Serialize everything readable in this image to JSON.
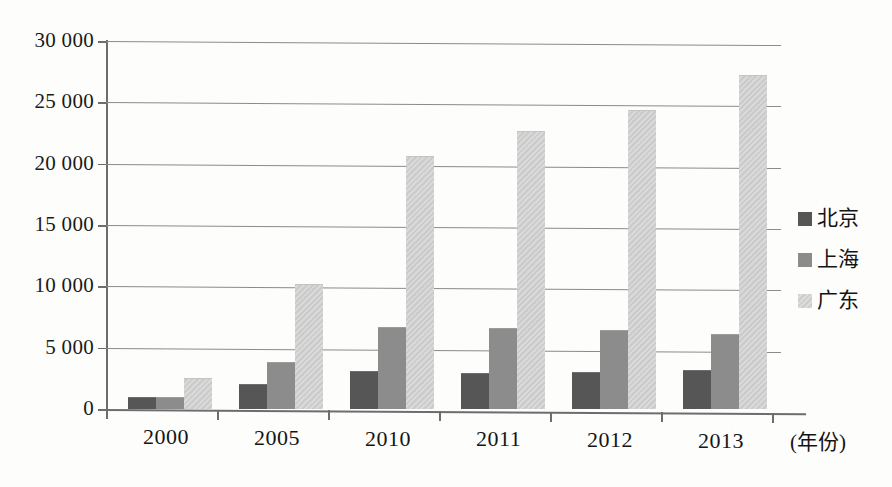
{
  "chart_data": {
    "type": "bar",
    "title": "",
    "xlabel": "(年份)",
    "ylabel": "",
    "categories": [
      "2000",
      "2005",
      "2010",
      "2011",
      "2012",
      "2013"
    ],
    "series": [
      {
        "name": "北京",
        "color": "#565656",
        "values": [
          1000,
          2000,
          3100,
          2900,
          3000,
          3200
        ]
      },
      {
        "name": "上海",
        "color": "#8c8c8c",
        "values": [
          1000,
          3800,
          6700,
          6600,
          6450,
          6100
        ]
      },
      {
        "name": "广东",
        "color": "#d4d4d4",
        "values": [
          2500,
          10200,
          20600,
          22700,
          24400,
          27200
        ]
      }
    ],
    "ylim": [
      0,
      30000
    ],
    "ytick_values": [
      0,
      5000,
      10000,
      15000,
      20000,
      25000,
      30000
    ],
    "ytick_labels": [
      "0",
      "5 000",
      "10 000",
      "15 000",
      "20 000",
      "25 000",
      "30 000"
    ],
    "grid": true,
    "legend_position": "right"
  },
  "legend": {
    "items": [
      {
        "label": "北京"
      },
      {
        "label": "上海"
      },
      {
        "label": "广东"
      }
    ]
  },
  "axes": {
    "x_axis_title": "(年份)"
  }
}
